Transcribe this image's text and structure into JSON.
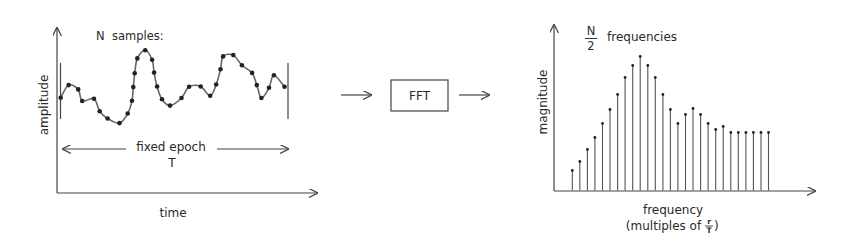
{
  "left_panel": {
    "y_axis_label": "amplitude",
    "x_axis_label": "time",
    "samples_label": "N  samples:",
    "epoch_label": "fixed epoch",
    "epoch_symbol": "T",
    "samples": [
      [
        60.7,
        97.7
      ],
      [
        68.6,
        85.1
      ],
      [
        78.2,
        89.4
      ],
      [
        82.2,
        101
      ],
      [
        94,
        98.7
      ],
      [
        99.7,
        111.2
      ],
      [
        107.6,
        118.5
      ],
      [
        119.5,
        123.1
      ],
      [
        127.7,
        113.5
      ],
      [
        132,
        100.7
      ],
      [
        133.3,
        87.1
      ],
      [
        134.7,
        73.3
      ],
      [
        137.3,
        58.4
      ],
      [
        145.2,
        50.2
      ],
      [
        152.1,
        59.7
      ],
      [
        154.1,
        72.6
      ],
      [
        157.1,
        86.5
      ],
      [
        162,
        99.3
      ],
      [
        170,
        105.6
      ],
      [
        181.5,
        98
      ],
      [
        189.1,
        86.8
      ],
      [
        200.7,
        86.5
      ],
      [
        210.2,
        95.7
      ],
      [
        216.2,
        84.5
      ],
      [
        220.5,
        69.3
      ],
      [
        223.1,
        56.4
      ],
      [
        233.3,
        55.1
      ],
      [
        241.9,
        65.3
      ],
      [
        252.1,
        72.9
      ],
      [
        256.8,
        85.1
      ],
      [
        261.4,
        98
      ],
      [
        269,
        87.8
      ],
      [
        273.9,
        75.2
      ],
      [
        284.5,
        86.8
      ]
    ]
  },
  "process": {
    "box_label": "FFT"
  },
  "right_panel": {
    "y_axis_label": "magnitude",
    "x_axis_label": "frequency",
    "x_axis_sublabel_prefix": "(multiples of ",
    "x_axis_sublabel_num": "r",
    "x_axis_sublabel_den": "T",
    "x_axis_sublabel_suffix": ")",
    "count_num": "N",
    "count_den": "2",
    "count_label": "frequencies"
  },
  "chart_data": {
    "type": "stem",
    "xlabel": "frequency (multiples of r/T)",
    "ylabel": "magnitude",
    "x": [
      1,
      2,
      3,
      4,
      5,
      6,
      7,
      8,
      9,
      10,
      11,
      12,
      13,
      14,
      15,
      16,
      17,
      18,
      19,
      20,
      21,
      22,
      23,
      24,
      25,
      26,
      27
    ],
    "values": [
      20,
      29,
      41,
      53,
      67,
      81,
      96,
      113,
      125,
      134,
      125,
      113,
      96,
      81,
      67,
      76,
      82,
      76,
      67,
      61,
      64,
      58,
      58,
      58,
      58,
      58,
      58
    ],
    "grid": false
  }
}
